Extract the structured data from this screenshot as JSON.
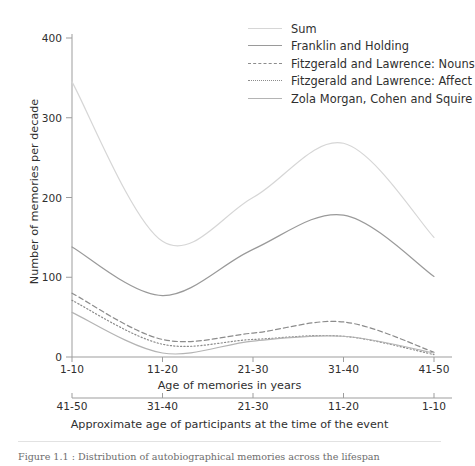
{
  "figure": {
    "caption": "Figure 1.1 : Distribution of autobiographical memories across the lifespan"
  },
  "legend": {
    "position": "top-right",
    "items": [
      {
        "label": "Sum",
        "key": "sum",
        "color": "#d6d6d6",
        "dash": "solid"
      },
      {
        "label": "Franklin and Holding",
        "key": "franklin",
        "color": "#9a9a9a",
        "dash": "solid"
      },
      {
        "label": "Fitzgerald and Lawrence: Nouns",
        "key": "nouns",
        "color": "#8c8c8c",
        "dash": "dashed"
      },
      {
        "label": "Fitzgerald and Lawrence: Affect",
        "key": "affect",
        "color": "#8c8c8c",
        "dash": "dotted"
      },
      {
        "label": "Zola Morgan, Cohen and Squire",
        "key": "zola",
        "color": "#b4b4b4",
        "dash": "solid"
      }
    ]
  },
  "axes": {
    "ylabel": "Number of memories per decade",
    "xlabel_top": "Age of memories in years",
    "xlabel_bottom": "Approximate age of participants at the time of the event",
    "yticks": [
      0,
      100,
      200,
      300,
      400
    ],
    "ylim": [
      0,
      400
    ],
    "xticks_top": [
      "1-10",
      "11-20",
      "21-30",
      "31-40",
      "41-50"
    ],
    "xticks_bottom": [
      "41-50",
      "31-40",
      "21-30",
      "11-20",
      "1-10"
    ],
    "grid": false
  },
  "chart_data": {
    "type": "line",
    "title": "",
    "xlabel": "Age of memories in years",
    "ylabel": "Number of memories per decade",
    "ylim": [
      0,
      400
    ],
    "grid": false,
    "legend_position": "top-right",
    "categories": [
      "1-10",
      "11-20",
      "21-30",
      "31-40",
      "41-50"
    ],
    "x_secondary_axis": {
      "label": "Approximate age of participants at the time of the event",
      "categories": [
        "41-50",
        "31-40",
        "21-30",
        "11-20",
        "1-10"
      ]
    },
    "series": [
      {
        "name": "Sum",
        "color": "#d6d6d6",
        "dash": "solid",
        "values": [
          345,
          145,
          200,
          268,
          150
        ],
        "points": [
          {
            "x": "1-10",
            "y": 345
          },
          {
            "x": "11-20",
            "y": 145
          },
          {
            "x": "21-30",
            "y": 200
          },
          {
            "x": "31-40",
            "y": 268
          },
          {
            "x": "41-50",
            "y": 150
          }
        ]
      },
      {
        "name": "Franklin and Holding",
        "color": "#9a9a9a",
        "dash": "solid",
        "values": [
          138,
          77,
          135,
          178,
          101
        ],
        "points": [
          {
            "x": "1-10",
            "y": 138
          },
          {
            "x": "11-20",
            "y": 77
          },
          {
            "x": "21-30",
            "y": 135
          },
          {
            "x": "31-40",
            "y": 178
          },
          {
            "x": "41-50",
            "y": 101
          }
        ]
      },
      {
        "name": "Fitzgerald and Lawrence: Nouns",
        "color": "#8c8c8c",
        "dash": "dashed",
        "values": [
          80,
          22,
          30,
          44,
          6
        ],
        "points": [
          {
            "x": "1-10",
            "y": 80
          },
          {
            "x": "11-20",
            "y": 22
          },
          {
            "x": "21-30",
            "y": 30
          },
          {
            "x": "31-40",
            "y": 44
          },
          {
            "x": "41-50",
            "y": 6
          }
        ]
      },
      {
        "name": "Fitzgerald and Lawrence: Affect",
        "color": "#8c8c8c",
        "dash": "dotted",
        "values": [
          71,
          16,
          22,
          26,
          3
        ],
        "points": [
          {
            "x": "1-10",
            "y": 71
          },
          {
            "x": "11-20",
            "y": 16
          },
          {
            "x": "21-30",
            "y": 22
          },
          {
            "x": "31-40",
            "y": 26
          },
          {
            "x": "41-50",
            "y": 3
          }
        ]
      },
      {
        "name": "Zola Morgan, Cohen and Squire",
        "color": "#b4b4b4",
        "dash": "solid",
        "values": [
          56,
          5,
          20,
          26,
          5
        ],
        "points": [
          {
            "x": "1-10",
            "y": 56
          },
          {
            "x": "11-20",
            "y": 5
          },
          {
            "x": "21-30",
            "y": 20
          },
          {
            "x": "31-40",
            "y": 26
          },
          {
            "x": "41-50",
            "y": 5
          }
        ]
      }
    ]
  }
}
